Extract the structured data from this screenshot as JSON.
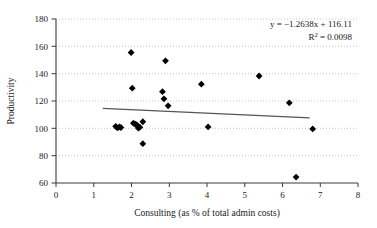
{
  "chart_data": {
    "type": "scatter",
    "title": "",
    "xlabel": "Consulting (as % of total admin costs)",
    "ylabel": "Productivity",
    "xlim": [
      0,
      8
    ],
    "ylim": [
      60,
      180
    ],
    "xticks": [
      0,
      1,
      2,
      3,
      4,
      5,
      6,
      7,
      8
    ],
    "yticks": [
      60,
      80,
      100,
      120,
      140,
      160,
      180
    ],
    "grid": "horizontal-dotted",
    "legend": "none",
    "marker": "filled-diamond",
    "marker_color": "#000000",
    "points": [
      {
        "x": 1.58,
        "y": 101.5
      },
      {
        "x": 1.63,
        "y": 100.3
      },
      {
        "x": 1.68,
        "y": 101.0
      },
      {
        "x": 1.72,
        "y": 100.6
      },
      {
        "x": 1.99,
        "y": 155.5
      },
      {
        "x": 2.02,
        "y": 129.4
      },
      {
        "x": 2.05,
        "y": 103.8
      },
      {
        "x": 2.1,
        "y": 103.0
      },
      {
        "x": 2.14,
        "y": 102.6
      },
      {
        "x": 2.18,
        "y": 100.2
      },
      {
        "x": 2.22,
        "y": 100.8
      },
      {
        "x": 2.3,
        "y": 104.8
      },
      {
        "x": 2.3,
        "y": 88.8
      },
      {
        "x": 2.82,
        "y": 126.8
      },
      {
        "x": 2.86,
        "y": 121.6
      },
      {
        "x": 2.9,
        "y": 149.4
      },
      {
        "x": 2.97,
        "y": 116.5
      },
      {
        "x": 3.85,
        "y": 132.3
      },
      {
        "x": 4.03,
        "y": 101.0
      },
      {
        "x": 5.38,
        "y": 138.3
      },
      {
        "x": 6.18,
        "y": 118.7
      },
      {
        "x": 6.36,
        "y": 64.3
      },
      {
        "x": 6.8,
        "y": 99.6
      }
    ],
    "trendline": {
      "slope": -1.2638,
      "intercept": 116.11,
      "x_start": 1.24,
      "x_end": 6.72,
      "color": "#555555"
    },
    "annotations": {
      "equation_prefix": "y = −1.2638x + 116.11",
      "r_squared_base": "R",
      "r_squared_exp": "2",
      "r_squared_value": " = 0.0098"
    }
  },
  "axis": {
    "y_tick_labels": [
      "180",
      "160",
      "140",
      "120",
      "100",
      "80",
      "60"
    ],
    "x_tick_labels": [
      "0",
      "1",
      "2",
      "3",
      "4",
      "5",
      "6",
      "7",
      "8"
    ],
    "x_title": "Consulting (as % of total admin costs)",
    "y_title": "Productivity"
  }
}
